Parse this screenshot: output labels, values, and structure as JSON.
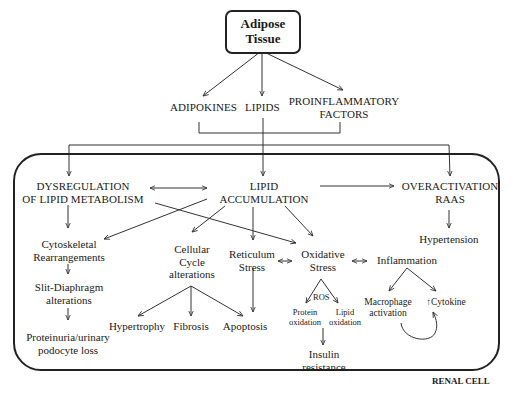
{
  "root": {
    "label_line1": "Adipose",
    "label_line2": "Tissue"
  },
  "level1": {
    "adipokines": "ADIPOKINES",
    "lipids": "LIPIDS",
    "proinflammatory_line1": "PROINFLAMMATORY",
    "proinflammatory_line2": "FACTORS"
  },
  "cell": {
    "caption": "RENAL CELL",
    "dysregulation_line1": "DYSREGULATION",
    "dysregulation_line2": "OF LIPID METABOLISM",
    "lipid_acc_line1": "LIPID",
    "lipid_acc_line2": "ACCUMULATION",
    "raas_line1": "OVERACTIVATION",
    "raas_line2": "RAAS",
    "hypertension": "Hypertension",
    "cytoskeletal_line1": "Cytoskeletal",
    "cytoskeletal_line2": "Rearrangements",
    "slit_line1": "Slit-Diaphragm",
    "slit_line2": "alterations",
    "proteinuria_line1": "Proteinuria/urinary",
    "proteinuria_line2": "podocyte  loss",
    "cellcycle_line1": "Cellular",
    "cellcycle_line2": "Cycle",
    "cellcycle_line3": "alterations",
    "hypertrophy": "Hypertrophy",
    "fibrosis": "Fibrosis",
    "apoptosis": "Apoptosis",
    "reticulum_line1": "Reticulum",
    "reticulum_line2": "Stress",
    "oxidative_line1": "Oxidative",
    "oxidative_line2": "Stress",
    "ros": "ROS",
    "protein_ox_line1": "Protein",
    "protein_ox_line2": "oxidation",
    "lipid_ox_line1": "Lipid",
    "lipid_ox_line2": "oxidation",
    "insulin_line1": "Insulin",
    "insulin_line2": "resistance",
    "inflammation": "Inflammation",
    "macrophage_line1": "Macrophage",
    "macrophage_line2": "activation",
    "cytokine": "↑Cytokine"
  },
  "colors": {
    "line": "#333333",
    "text": "#1a1a1a",
    "background": "#ffffff"
  }
}
